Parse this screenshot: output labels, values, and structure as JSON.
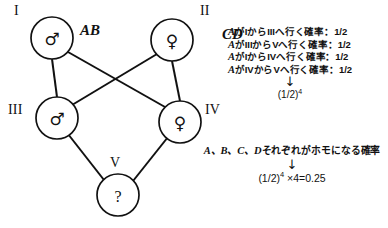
{
  "diagram": {
    "type": "pedigree",
    "generations": [
      {
        "id": "I",
        "label": "I"
      },
      {
        "id": "II",
        "label": "II"
      },
      {
        "id": "III",
        "label": "III"
      },
      {
        "id": "IV",
        "label": "IV"
      },
      {
        "id": "V",
        "label": "V"
      }
    ],
    "individuals": [
      {
        "id": "I",
        "sex": "male",
        "symbol": "♂",
        "cx": 52,
        "cy": 38,
        "r": 21,
        "genotype": "AB"
      },
      {
        "id": "II",
        "sex": "female",
        "symbol": "♀",
        "cx": 172,
        "cy": 40,
        "r": 21,
        "genotype": "CD"
      },
      {
        "id": "III",
        "sex": "male",
        "symbol": "♂",
        "cx": 57,
        "cy": 118,
        "r": 21,
        "genotype": ""
      },
      {
        "id": "IV",
        "sex": "female",
        "symbol": "♀",
        "cx": 180,
        "cy": 122,
        "r": 21,
        "genotype": ""
      },
      {
        "id": "V",
        "sex": "unknown",
        "symbol": "?",
        "cx": 118,
        "cy": 195,
        "r": 21,
        "genotype": ""
      }
    ],
    "genotype_labels": [
      {
        "text": "AB",
        "x": 80,
        "y": 24
      },
      {
        "text": "CD",
        "x": 222,
        "y": 28
      }
    ],
    "generation_label_positions": [
      {
        "text": "I",
        "x": 14,
        "y": 6
      },
      {
        "text": "II",
        "x": 200,
        "y": 6
      },
      {
        "text": "III",
        "x": 8,
        "y": 104
      },
      {
        "text": "IV",
        "x": 205,
        "y": 104
      },
      {
        "text": "V",
        "x": 110,
        "y": 158
      }
    ],
    "edges": [
      {
        "from": "I",
        "to": "III"
      },
      {
        "from": "II",
        "to": "IV"
      },
      {
        "from": "I",
        "to": "IV"
      },
      {
        "from": "II",
        "to": "III"
      },
      {
        "from": "III",
        "to": "V"
      },
      {
        "from": "IV",
        "to": "V"
      }
    ]
  },
  "notes": {
    "probability_lines": [
      {
        "gene": "A",
        "text": "がIからIIIへ行く確率：1/2"
      },
      {
        "gene": "A",
        "text": "がIIIからVへ行く確率：1/2"
      },
      {
        "gene": "A",
        "text": "がIからIVへ行く確率：1/2"
      },
      {
        "gene": "A",
        "text": "がIVからVへ行く確率：1/2"
      }
    ],
    "arrow": "↓",
    "result_base": "(1/2)",
    "result_exponent": "4"
  },
  "conclusion": {
    "genes": "A、B、C、D",
    "text": "それぞれがホモになる確率",
    "arrow": "↓",
    "formula_base": "(1/2)",
    "formula_exponent": "4",
    "formula_rest": " ×4=0.25"
  },
  "colors": {
    "ink": "#111111",
    "background": "#ffffff"
  }
}
